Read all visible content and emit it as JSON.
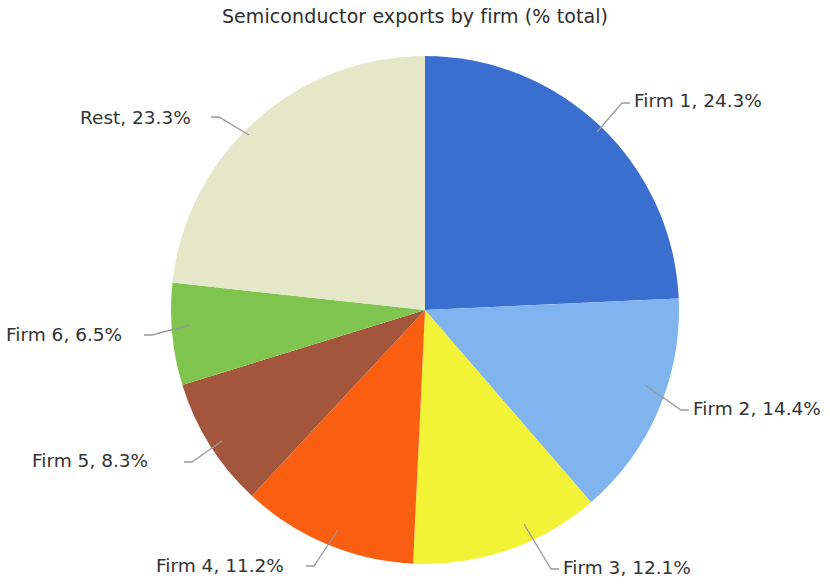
{
  "chart_data": {
    "type": "pie",
    "title": "Semiconductor exports by firm (% total)",
    "xlabel": "",
    "ylabel": "",
    "legend_position": "none",
    "grid": false,
    "value_unit": "%",
    "start_angle_deg": 0,
    "direction": "clockwise",
    "categories": [
      "Firm 1",
      "Firm 2",
      "Firm 3",
      "Firm 4",
      "Firm 5",
      "Firm 6",
      "Rest"
    ],
    "values": [
      24.3,
      14.4,
      12.1,
      11.2,
      8.3,
      6.5,
      23.3
    ],
    "colors": [
      "#3a6fd0",
      "#7fb4ee",
      "#f2f236",
      "#f95e11",
      "#a4563c",
      "#80c450",
      "#e4e8c8"
    ],
    "labels": [
      "Firm 1, 24.3%",
      "Firm 2, 14.4%",
      "Firm 3, 12.1%",
      "Firm 4, 11.2%",
      "Firm 5, 8.3%",
      "Firm 6, 6.5%",
      "Rest, 23.3%"
    ],
    "slices": [
      {
        "name": "Firm 1",
        "value": 24.3,
        "label": "Firm 1, 24.3%",
        "color": "#3a6fd0",
        "label_x": 634,
        "label_y": 107,
        "label_anchor": "start",
        "leader": "597,132 622,103 630,103"
      },
      {
        "name": "Firm 2",
        "value": 14.4,
        "label": "Firm 2, 14.4%",
        "color": "#7fb4ee",
        "label_x": 693,
        "label_y": 415,
        "label_anchor": "start",
        "leader": "645,385 681,410 689,410"
      },
      {
        "name": "Firm 3",
        "value": 12.1,
        "label": "Firm 3, 12.1%",
        "color": "#f2f236",
        "label_x": 563,
        "label_y": 574,
        "label_anchor": "start",
        "leader": "524,524 551,569 559,569"
      },
      {
        "name": "Firm 4",
        "value": 11.2,
        "label": "Firm 4, 11.2%",
        "color": "#f95e11",
        "label_x": 156,
        "label_y": 572,
        "label_anchor": "start",
        "leader": "338,530 314,566 306,566"
      },
      {
        "name": "Firm 5",
        "value": 8.3,
        "label": "Firm 5, 8.3%",
        "color": "#a4563c",
        "label_x": 32,
        "label_y": 467,
        "label_anchor": "start",
        "leader": "222,441 192,462 184,462"
      },
      {
        "name": "Firm 6",
        "value": 6.5,
        "label": "Firm 6, 6.5%",
        "color": "#80c450",
        "label_x": 6,
        "label_y": 341,
        "label_anchor": "start",
        "leader": "190,325 152,335 144,335"
      },
      {
        "name": "Rest",
        "value": 23.3,
        "label": "Rest, 23.3%",
        "color": "#e4e8c8",
        "label_x": 80,
        "label_y": 124,
        "label_anchor": "start",
        "leader": "249,135 219,117 211,117"
      }
    ],
    "geometry": {
      "center_x": 425,
      "center_y": 310,
      "radius": 254
    }
  }
}
